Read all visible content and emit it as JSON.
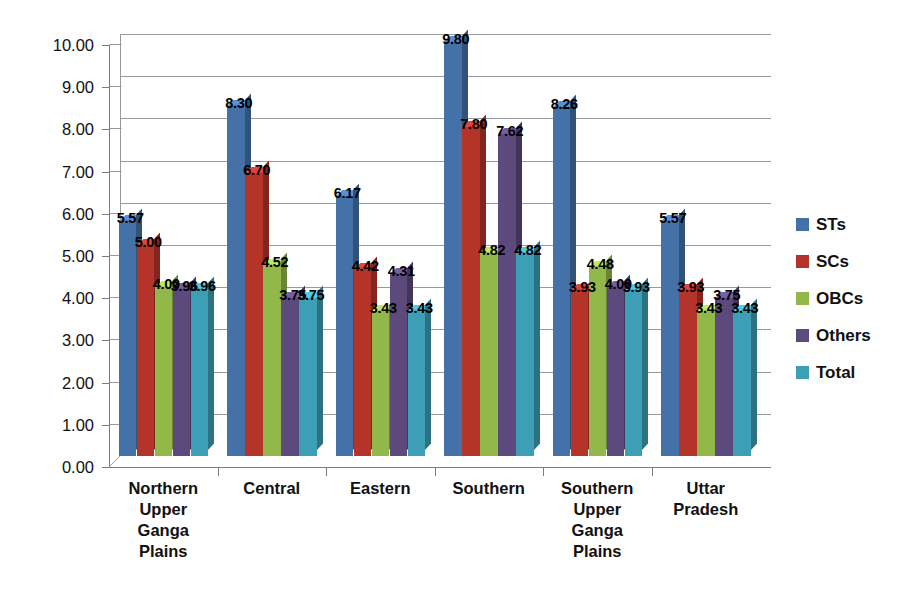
{
  "chart_data": {
    "type": "bar",
    "title": "",
    "subtitle": "",
    "xlabel": "",
    "ylabel": "Kg/capita/month",
    "ylim": [
      0,
      10
    ],
    "ytick_step": 1,
    "ytick_labels": [
      "0.00",
      "1.00",
      "2.00",
      "3.00",
      "4.00",
      "5.00",
      "6.00",
      "7.00",
      "8.00",
      "9.00",
      "10.00"
    ],
    "grid": true,
    "legend_position": "right",
    "style": "3d-clustered-column",
    "categories": [
      "Northern Upper Ganga Plains",
      "Central",
      "Eastern",
      "Southern",
      "Southern Upper Ganga Plains",
      "Uttar Pradesh"
    ],
    "category_lines": [
      [
        "Northern",
        "Upper",
        "Ganga",
        "Plains"
      ],
      [
        "Central"
      ],
      [
        "Eastern"
      ],
      [
        "Southern"
      ],
      [
        "Southern",
        "Upper",
        "Ganga",
        "Plains"
      ],
      [
        "Uttar",
        "Pradesh"
      ]
    ],
    "series": [
      {
        "name": "STs",
        "color": "#4472a8",
        "values": [
          5.57,
          8.3,
          6.17,
          9.8,
          8.26,
          5.57
        ],
        "labels": [
          "5.57",
          "8.30",
          "6.17",
          "9.80",
          "8.26",
          "5.57"
        ]
      },
      {
        "name": "SCs",
        "color": "#b5342a",
        "values": [
          5.0,
          6.7,
          4.42,
          7.8,
          3.93,
          3.93
        ],
        "labels": [
          "5.00",
          "6.70",
          "4.42",
          "7.80",
          "3.93",
          "3.93"
        ]
      },
      {
        "name": "OBCs",
        "color": "#93b84a",
        "values": [
          4.0,
          4.52,
          3.43,
          4.82,
          4.48,
          3.43
        ],
        "labels": [
          "4.00",
          "4.52",
          "3.43",
          "4.82",
          "4.48",
          "3.43"
        ]
      },
      {
        "name": "Others",
        "color": "#5d4a7d",
        "values": [
          3.96,
          3.75,
          4.31,
          7.62,
          4.0,
          3.75
        ],
        "labels": [
          "3.96",
          "3.75",
          "4.31",
          "7.62",
          "4.00",
          "3.75"
        ]
      },
      {
        "name": "Total",
        "color": "#3d9fb5",
        "values": [
          3.96,
          3.75,
          3.43,
          4.82,
          3.93,
          3.43
        ],
        "labels": [
          "3.96",
          "3.75",
          "3.43",
          "4.82",
          "3.93",
          "3.43"
        ]
      }
    ]
  },
  "legend": {
    "items": [
      {
        "label": "STs",
        "color": "#4472a8"
      },
      {
        "label": "SCs",
        "color": "#b5342a"
      },
      {
        "label": "OBCs",
        "color": "#93b84a"
      },
      {
        "label": "Others",
        "color": "#5d4a7d"
      },
      {
        "label": "Total",
        "color": "#3d9fb5"
      }
    ]
  },
  "axes": {
    "y_title": "Kg/capita/month"
  }
}
